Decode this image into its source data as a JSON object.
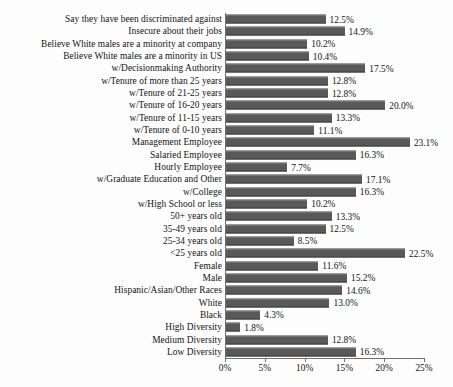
{
  "chart_data": {
    "type": "bar",
    "orientation": "horizontal",
    "title": "",
    "xlabel": "",
    "ylabel": "",
    "xlim": [
      0,
      25
    ],
    "xtick_labels": [
      "0%",
      "5%",
      "10%",
      "15%",
      "20%",
      "25%"
    ],
    "xticks": [
      0,
      5,
      10,
      15,
      20,
      25
    ],
    "grid": false,
    "legend": false,
    "value_suffix": "%",
    "bar_color": "#595959",
    "axis_color": "#6f6f6f",
    "background_color": "#fdfdfd",
    "categories": [
      "Say they have been discriminated against",
      "Insecure about their jobs",
      "Believe White males are a minority at company",
      "Believe White males are a minority in US",
      "w/Decisionmaking Authority",
      "w/Tenure of more than 25 years",
      "w/Tenure of 21-25 years",
      "w/Tenure of 16-20 years",
      "w/Tenure of 11-15 years",
      "w/Tenure of 0-10 years",
      "Management Employee",
      "Salaried Employee",
      "Hourly Employee",
      "w/Graduate Education and Other",
      "w/College",
      "w/High School or less",
      "50+ years old",
      "35-49 years old",
      "25-34 years old",
      "<25 years old",
      "Female",
      "Male",
      "Hispanic/Asian/Other Races",
      "White",
      "Black",
      "High Diversity",
      "Medium Diversity",
      "Low Diversity"
    ],
    "values": [
      12.5,
      14.9,
      10.2,
      10.4,
      17.5,
      12.8,
      12.8,
      20.0,
      13.3,
      11.1,
      23.1,
      16.3,
      7.7,
      17.1,
      16.3,
      10.2,
      13.3,
      12.5,
      8.5,
      22.5,
      11.6,
      15.2,
      14.6,
      13.0,
      4.3,
      1.8,
      12.8,
      16.3
    ],
    "value_labels": [
      "12.5%",
      "14.9%",
      "10.2%",
      "10.4%",
      "17.5%",
      "12.8%",
      "12.8%",
      "20.0%",
      "13.3%",
      "11.1%",
      "23.1%",
      "16.3%",
      "7.7%",
      "17.1%",
      "16.3%",
      "10.2%",
      "13.3%",
      "12.5%",
      "8.5%",
      "22.5%",
      "11.6%",
      "15.2%",
      "14.6%",
      "13.0%",
      "4.3%",
      "1.8%",
      "12.8%",
      "16.3%"
    ]
  }
}
